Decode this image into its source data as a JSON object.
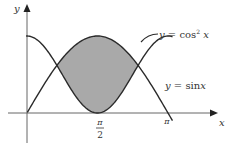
{
  "diagram": {
    "y_axis_label": "y",
    "x_axis_label": "x",
    "curves": [
      {
        "name": "cos-squared",
        "label": "y = cos²x"
      },
      {
        "name": "sine",
        "label": "y = sinx"
      }
    ],
    "tick_labels": {
      "pi_over_2_num": "π",
      "pi_over_2_den": "2",
      "pi": "π"
    },
    "shaded_region": "area between y = sinx and y = cos²x",
    "colors": {
      "curve": "#2a2a2a",
      "axis": "#555555",
      "shade": "#a9a9a9"
    }
  }
}
